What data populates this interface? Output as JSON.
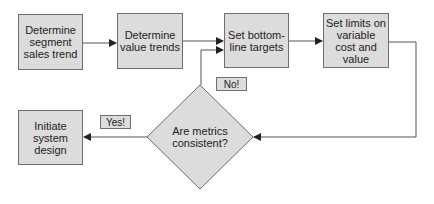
{
  "diagram": {
    "type": "flowchart",
    "colors": {
      "node_fill": "#dcdcdc",
      "node_border": "#6e6e6e",
      "connector": "#555555",
      "background": "#ffffff"
    },
    "nodes": [
      {
        "id": "n1",
        "shape": "rect",
        "label": "Determine segment sales trend"
      },
      {
        "id": "n2",
        "shape": "rect",
        "label": "Determine value trends"
      },
      {
        "id": "n3",
        "shape": "rect",
        "label": "Set bottom-line targets"
      },
      {
        "id": "n4",
        "shape": "rect",
        "label": "Set limits on variable cost and value"
      },
      {
        "id": "n5",
        "shape": "diamond",
        "label": "Are metrics consistent?"
      },
      {
        "id": "n6",
        "shape": "rect",
        "label": "Initiate system design"
      }
    ],
    "edge_labels": {
      "no": "No!",
      "yes": "Yes!"
    },
    "edges": [
      {
        "from": "n1",
        "to": "n2",
        "label": ""
      },
      {
        "from": "n2",
        "to": "n3",
        "label": ""
      },
      {
        "from": "n3",
        "to": "n4",
        "label": ""
      },
      {
        "from": "n4",
        "to": "n5",
        "label": ""
      },
      {
        "from": "n5",
        "to": "n3",
        "label": "No!"
      },
      {
        "from": "n5",
        "to": "n6",
        "label": "Yes!"
      }
    ]
  }
}
